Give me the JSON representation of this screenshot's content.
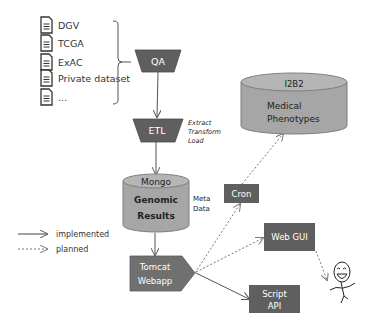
{
  "sources": {
    "items": [
      {
        "label": "DGV",
        "icon": "document-icon"
      },
      {
        "label": "TCGA",
        "icon": "document-icon"
      },
      {
        "label": "ExAC",
        "icon": "document-icon"
      },
      {
        "label": "Private dataset",
        "icon": "document-icon"
      },
      {
        "label": "...",
        "icon": "document-icon"
      }
    ]
  },
  "nodes": {
    "qa": {
      "label": "QA"
    },
    "etl": {
      "label": "ETL",
      "note": [
        "Extract",
        "Transform",
        "Load"
      ]
    },
    "mongo": {
      "title": "Mongo",
      "lines": [
        "Genomic",
        "Results"
      ],
      "note": [
        "Meta",
        "Data"
      ]
    },
    "i2b2": {
      "title": "I2B2",
      "lines": [
        "Medical",
        "Phenotypes"
      ]
    },
    "cron": {
      "label": "Cron"
    },
    "webgui": {
      "label": "Web GUI"
    },
    "tomcat": {
      "lines": [
        "Tomcat",
        "Webapp"
      ]
    },
    "script": {
      "lines": [
        "Script",
        "API"
      ]
    }
  },
  "legend": {
    "implemented": "implemented",
    "planned": "planned"
  },
  "colors": {
    "box_fill": "#5f5f5f",
    "cylinder_fill": "#a6a6a6",
    "cylinder_top": "#bfbfbf",
    "line": "#6e6e6e"
  }
}
